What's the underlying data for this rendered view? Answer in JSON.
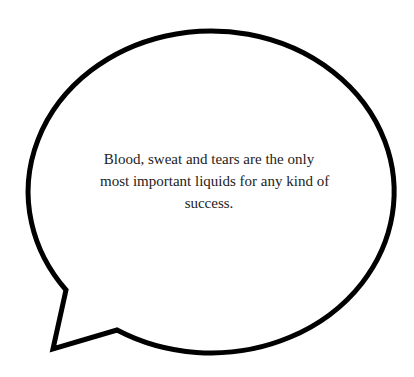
{
  "bubble": {
    "stroke_color": "#000000",
    "fill_color": "#ffffff",
    "quote_lines": [
      "Blood, sweat and tears are the only",
      "most important liquids for any kind of",
      "success."
    ]
  }
}
